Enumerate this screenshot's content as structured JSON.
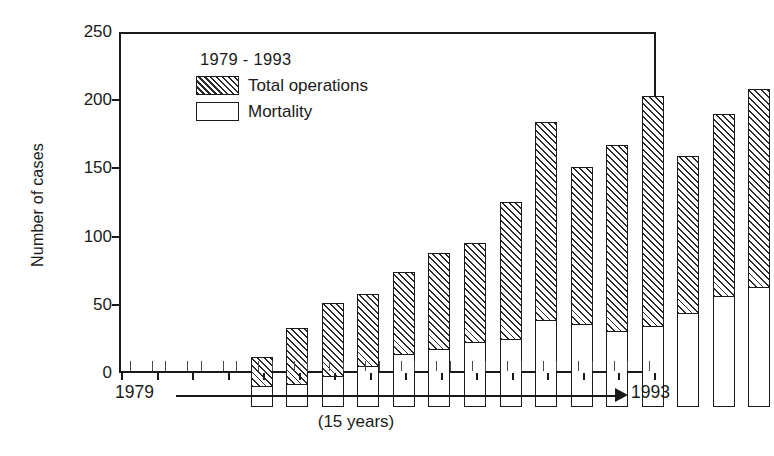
{
  "chart_data": {
    "type": "bar",
    "subtype": "stacked-bar",
    "title": "",
    "xlabel": "(15 years)",
    "ylabel": "Number of cases",
    "categories": [
      "1979",
      "1980",
      "1981",
      "1982",
      "1983",
      "1984",
      "1985",
      "1986",
      "1987",
      "1988",
      "1989",
      "1990",
      "1991",
      "1992",
      "1993"
    ],
    "x_axis_start_label": "1979",
    "x_axis_end_label": "1993",
    "ylim": [
      0,
      250
    ],
    "yticks": [
      0,
      50,
      100,
      150,
      200,
      250
    ],
    "ytick_labels": [
      "0",
      "50",
      "100",
      "150",
      "200",
      "250"
    ],
    "grid": false,
    "legend_position": "inside-top-left",
    "legend_title": "1979 - 1993",
    "series": [
      {
        "name": "Total operations",
        "fill": "diagonal-hatch",
        "values": [
          37,
          58,
          76,
          83,
          99,
          113,
          120,
          150,
          209,
          176,
          192,
          228,
          184,
          215,
          233
        ]
      },
      {
        "name": "Mortality",
        "fill": "white",
        "values": [
          15,
          16,
          22,
          29,
          38,
          42,
          47,
          49,
          63,
          60,
          55,
          59,
          68,
          81,
          87
        ]
      }
    ]
  },
  "axis": {
    "y_label": "Number of cases",
    "x_caption": "(15 years)",
    "x_start": "1979",
    "x_end": "1993"
  },
  "legend": {
    "title": "1979 - 1993",
    "entries": [
      {
        "label": "Total operations",
        "swatch": "hatched"
      },
      {
        "label": "Mortality",
        "swatch": "plain"
      }
    ]
  },
  "colors": {
    "ink": "#1a1a1a",
    "hatch": "#2b2b2b",
    "background": "#ffffff"
  }
}
